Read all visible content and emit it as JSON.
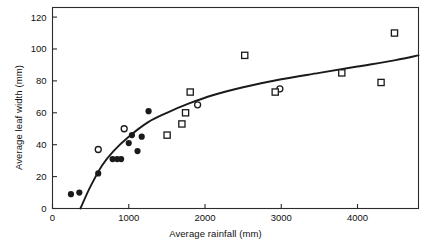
{
  "chart_data": {
    "type": "scatter",
    "title": "",
    "xlabel": "Average rainfall (mm)",
    "ylabel": "Average leaf width (mm)",
    "xlim": [
      0,
      4800
    ],
    "ylim": [
      0,
      126
    ],
    "xticks": [
      0,
      1000,
      2000,
      3000,
      4000
    ],
    "xtick_labels": [
      "0",
      "1000",
      "2000",
      "3000",
      "4000"
    ],
    "yticks": [
      0,
      20,
      40,
      60,
      80,
      100,
      120
    ],
    "ytick_labels": [
      "0",
      "20",
      "40",
      "60",
      "80",
      "100",
      "120"
    ],
    "grid": false,
    "legend": false,
    "frame": "box",
    "series": [
      {
        "name": "filled-circles",
        "marker": "filled-circle",
        "color": "#1a1a1a",
        "points": [
          {
            "x": 242,
            "y": 9
          },
          {
            "x": 352,
            "y": 10
          },
          {
            "x": 600,
            "y": 22
          },
          {
            "x": 788,
            "y": 31
          },
          {
            "x": 848,
            "y": 31
          },
          {
            "x": 900,
            "y": 31
          },
          {
            "x": 1000,
            "y": 41
          },
          {
            "x": 1042,
            "y": 46
          },
          {
            "x": 1115,
            "y": 36
          },
          {
            "x": 1170,
            "y": 45
          },
          {
            "x": 1260,
            "y": 61
          }
        ]
      },
      {
        "name": "open-circles",
        "marker": "open-circle",
        "color": "#1a1a1a",
        "points": [
          {
            "x": 600,
            "y": 37
          },
          {
            "x": 940,
            "y": 50
          },
          {
            "x": 1903,
            "y": 65
          },
          {
            "x": 2982,
            "y": 75
          }
        ]
      },
      {
        "name": "open-squares",
        "marker": "open-square",
        "color": "#1a1a1a",
        "points": [
          {
            "x": 1503,
            "y": 46
          },
          {
            "x": 1697,
            "y": 53
          },
          {
            "x": 1745,
            "y": 60
          },
          {
            "x": 1806,
            "y": 73
          },
          {
            "x": 2521,
            "y": 96
          },
          {
            "x": 2921,
            "y": 73
          },
          {
            "x": 3794,
            "y": 85
          },
          {
            "x": 4309,
            "y": 79
          },
          {
            "x": 4485,
            "y": 110
          }
        ]
      }
    ],
    "fit_curve": {
      "name": "fitted-curve",
      "color": "#1a1a1a",
      "x_start": 365,
      "x_end": 4800,
      "y_at_x_end": 96,
      "points": [
        {
          "x": 365,
          "y": 0
        },
        {
          "x": 500,
          "y": 14
        },
        {
          "x": 650,
          "y": 27
        },
        {
          "x": 800,
          "y": 36
        },
        {
          "x": 1000,
          "y": 45
        },
        {
          "x": 1250,
          "y": 54
        },
        {
          "x": 1500,
          "y": 60
        },
        {
          "x": 1800,
          "y": 66
        },
        {
          "x": 2100,
          "y": 71
        },
        {
          "x": 2500,
          "y": 76
        },
        {
          "x": 3000,
          "y": 81
        },
        {
          "x": 3500,
          "y": 85
        },
        {
          "x": 4000,
          "y": 89
        },
        {
          "x": 4500,
          "y": 93
        },
        {
          "x": 4800,
          "y": 96
        }
      ]
    }
  }
}
